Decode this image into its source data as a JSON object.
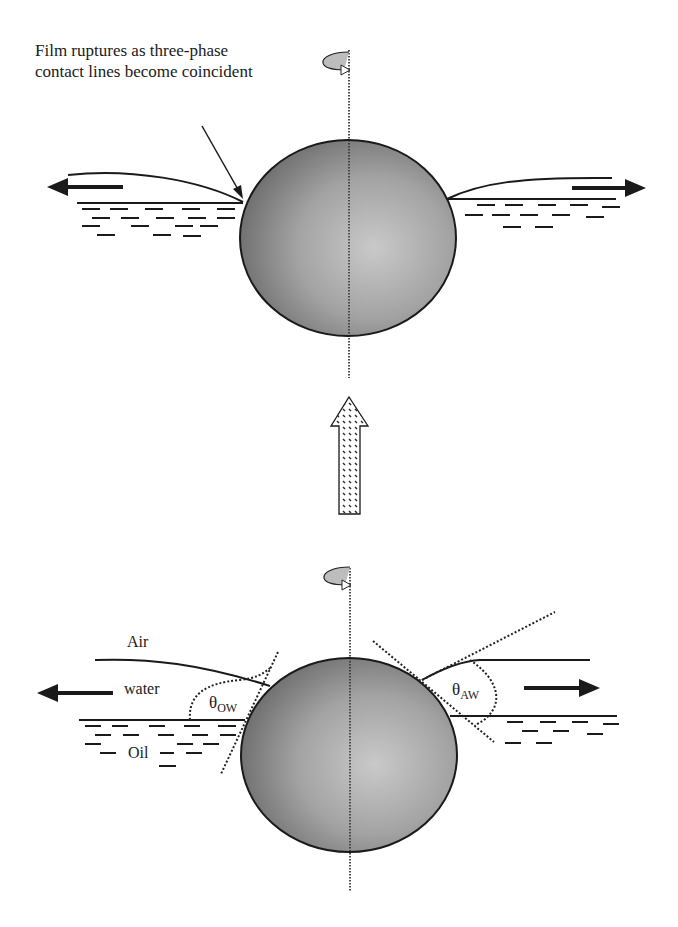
{
  "figure": {
    "top_panel": {
      "annotation": "Film ruptures as three-phase contact lines become coincident"
    },
    "transition_arrow": {
      "direction": "up",
      "icon": "hatched-up-arrow"
    },
    "bottom_panel": {
      "labels": {
        "air": "Air",
        "water": "water",
        "oil": "Oil",
        "theta_ow_symbol": "θ",
        "theta_ow_sub": "OW",
        "theta_aw_symbol": "θ",
        "theta_aw_sub": "AW"
      }
    },
    "icons": {
      "rotation_top": "rotation-arrow",
      "rotation_bottom": "rotation-arrow",
      "flow_left": "left-arrow",
      "flow_right": "right-arrow"
    },
    "colors": {
      "ink": "#1a1a1a",
      "sphere_dark": "#6e6e6e",
      "sphere_light": "#c8c8c8",
      "background": "#ffffff"
    }
  }
}
